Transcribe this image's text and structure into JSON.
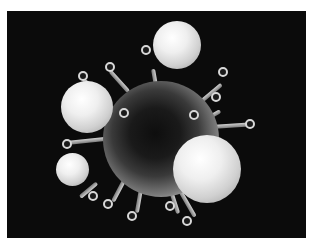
{
  "image": {
    "subject": "3D rendering of a spiked virus particle surrounded by white spherical cells",
    "background_color": "#0b0b0b",
    "border_color": "#ffffff"
  }
}
